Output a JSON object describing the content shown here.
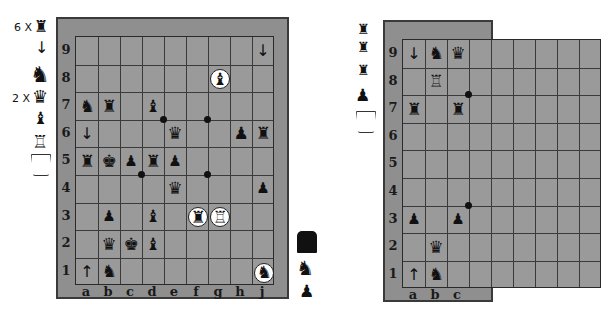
{
  "boards": [
    {
      "id": "left",
      "ranks": [
        "9",
        "8",
        "7",
        "6",
        "5",
        "4",
        "3",
        "2",
        "1"
      ],
      "files": [
        "a",
        "b",
        "c",
        "d",
        "e",
        "f",
        "g",
        "h",
        "j"
      ],
      "pieces": [
        {
          "square": "j9",
          "glyph": "↓",
          "type": "arrow-piece",
          "highlight": false
        },
        {
          "square": "g8",
          "glyph": "♝",
          "type": "bishop",
          "highlight": true
        },
        {
          "square": "a7",
          "glyph": "♞",
          "type": "dragon-horse",
          "highlight": false
        },
        {
          "square": "b7",
          "glyph": "♜",
          "type": "goblet",
          "highlight": false
        },
        {
          "square": "d7",
          "glyph": "♝",
          "type": "helmet",
          "highlight": false
        },
        {
          "square": "a6",
          "glyph": "↓",
          "type": "arrow-piece",
          "highlight": false
        },
        {
          "square": "e6",
          "glyph": "♛",
          "type": "queen-bust",
          "highlight": false
        },
        {
          "square": "h6",
          "glyph": "♟",
          "type": "hanging-piece",
          "highlight": false
        },
        {
          "square": "j6",
          "glyph": "♜",
          "type": "goblet",
          "highlight": false
        },
        {
          "square": "a5",
          "glyph": "♜",
          "type": "goblet",
          "highlight": false
        },
        {
          "square": "b5",
          "glyph": "♚",
          "type": "mask",
          "highlight": false
        },
        {
          "square": "c5",
          "glyph": "♟",
          "type": "pawn",
          "highlight": false
        },
        {
          "square": "d5",
          "glyph": "♜",
          "type": "goblet",
          "highlight": false
        },
        {
          "square": "e5",
          "glyph": "♟",
          "type": "pawn",
          "highlight": false
        },
        {
          "square": "e4",
          "glyph": "♛",
          "type": "queen-bust",
          "highlight": false
        },
        {
          "square": "j4",
          "glyph": "♟",
          "type": "pawn",
          "highlight": false
        },
        {
          "square": "b3",
          "glyph": "♟",
          "type": "pawn",
          "highlight": false
        },
        {
          "square": "d3",
          "glyph": "♝",
          "type": "helmet",
          "highlight": false
        },
        {
          "square": "f3",
          "glyph": "♜",
          "type": "goblet",
          "highlight": true
        },
        {
          "square": "g3",
          "glyph": "♖",
          "type": "tower",
          "highlight": true
        },
        {
          "square": "b2",
          "glyph": "♛",
          "type": "queen-bust",
          "highlight": false
        },
        {
          "square": "c2",
          "glyph": "♚",
          "type": "crown",
          "highlight": false
        },
        {
          "square": "d2",
          "glyph": "♝",
          "type": "helmet",
          "highlight": false
        },
        {
          "square": "a1",
          "glyph": "↑",
          "type": "arrow-piece",
          "highlight": false
        },
        {
          "square": "b1",
          "glyph": "♞",
          "type": "knight",
          "highlight": false
        },
        {
          "square": "j1",
          "glyph": "♞",
          "type": "dragon-horse",
          "highlight": true
        }
      ],
      "dots": [
        "d6/e7",
        "f6/g7",
        "c4/d3",
        "f4/g3"
      ]
    },
    {
      "id": "right",
      "ranks": [
        "9",
        "8",
        "7",
        "6",
        "5",
        "4",
        "3",
        "2",
        "1"
      ],
      "files": [
        "a",
        "b",
        "c"
      ],
      "pieces": [
        {
          "square": "a9",
          "glyph": "↓",
          "type": "arrow-piece",
          "highlight": false
        },
        {
          "square": "b9",
          "glyph": "♞",
          "type": "dragon-horse",
          "highlight": false
        },
        {
          "square": "c9",
          "glyph": "♛",
          "type": "queen-bust",
          "highlight": false
        },
        {
          "square": "b8",
          "glyph": "♖",
          "type": "tower",
          "highlight": false
        },
        {
          "square": "a7",
          "glyph": "♜",
          "type": "goblet",
          "highlight": false
        },
        {
          "square": "c7",
          "glyph": "♜",
          "type": "goblet",
          "highlight": false
        },
        {
          "square": "a3",
          "glyph": "♟",
          "type": "pawn",
          "highlight": false
        },
        {
          "square": "c3",
          "glyph": "♟",
          "type": "pawn",
          "highlight": false
        },
        {
          "square": "b2",
          "glyph": "♛",
          "type": "queen-bust",
          "highlight": false
        },
        {
          "square": "a1",
          "glyph": "↑",
          "type": "arrow-piece",
          "highlight": false
        },
        {
          "square": "b1",
          "glyph": "♞",
          "type": "knight",
          "highlight": false
        }
      ]
    }
  ],
  "left_reserve": [
    {
      "count": "6 X",
      "glyph": "♜",
      "type": "goblet"
    },
    {
      "count": "",
      "glyph": "↓",
      "type": "arrow-piece"
    },
    {
      "count": "",
      "glyph": "♞",
      "type": "dragon-horse"
    },
    {
      "count": "2 X",
      "glyph": "♛",
      "type": "queen-bust"
    },
    {
      "count": "",
      "glyph": "♝",
      "type": "helmet"
    },
    {
      "count": "",
      "glyph": "♖",
      "type": "tower"
    },
    {
      "count": "",
      "glyph": "",
      "type": "empty-cup"
    }
  ],
  "middle_reserve": [
    {
      "glyph": "■",
      "type": "block"
    },
    {
      "glyph": "♞",
      "type": "knight"
    },
    {
      "glyph": "♟",
      "type": "pawn"
    }
  ],
  "right_reserve": [
    {
      "glyph": "♜",
      "type": "goblet"
    },
    {
      "glyph": "♜",
      "type": "goblet"
    },
    {
      "glyph": "♜",
      "type": "goblet"
    },
    {
      "glyph": "♟",
      "type": "hanging-piece"
    },
    {
      "glyph": "",
      "type": "empty-cup"
    }
  ]
}
